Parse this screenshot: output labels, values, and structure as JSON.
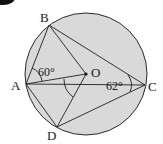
{
  "figure": {
    "type": "circle-geometry",
    "circle": {
      "center_label": "O",
      "fill": "#d9d9d9",
      "stroke": "#2a2a2a"
    },
    "points": {
      "A": {
        "label": "A"
      },
      "B": {
        "label": "B"
      },
      "C": {
        "label": "C"
      },
      "D": {
        "label": "D"
      },
      "O": {
        "label": "O"
      }
    },
    "angles": {
      "BAO": {
        "label": "60°"
      },
      "ACB": {
        "label": "62°"
      }
    },
    "segments": [
      "AB",
      "BC",
      "AC",
      "AO",
      "BO",
      "OD",
      "AD",
      "DC"
    ]
  }
}
